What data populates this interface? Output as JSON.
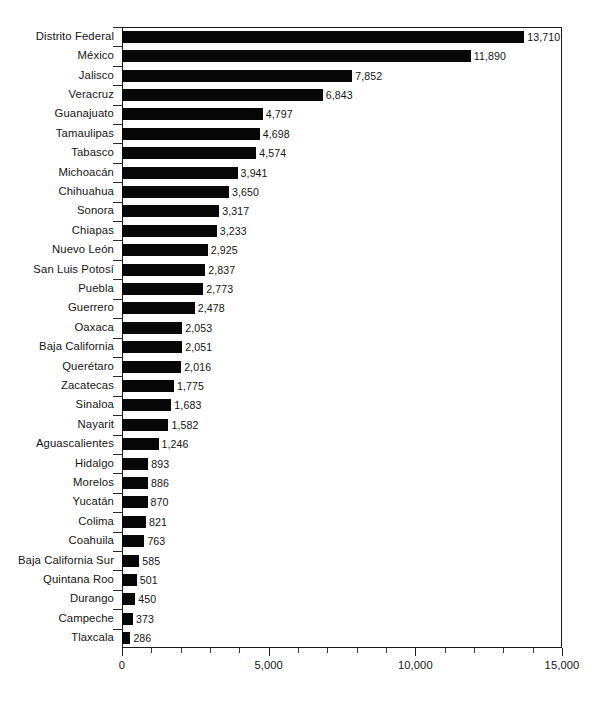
{
  "chart_data": {
    "type": "bar",
    "orientation": "horizontal",
    "title": "",
    "subtitle": "",
    "xlabel": "",
    "ylabel": "",
    "xlim": [
      0,
      15000
    ],
    "grid": false,
    "legend": null,
    "bar_color": "#070707",
    "background_color": "#ffffff",
    "axis_color": "#1a1a1a",
    "text_color": "#141414",
    "x_tick_labels": [
      "0",
      "5,000",
      "10,000",
      "15,000"
    ],
    "x_tick_values": [
      0,
      5000,
      10000,
      15000
    ],
    "x_minor_tick_step": 1000,
    "categories": [
      "Distrito Federal",
      "México",
      "Jalisco",
      "Veracruz",
      "Guanajuato",
      "Tamaulipas",
      "Tabasco",
      "Michoacán",
      "Chihuahua",
      "Sonora",
      "Chiapas",
      "Nuevo León",
      "San Luis Potosí",
      "Puebla",
      "Guerrero",
      "Oaxaca",
      "Baja California",
      "Querétaro",
      "Zacatecas",
      "Sinaloa",
      "Nayarit",
      "Aguascalientes",
      "Hidalgo",
      "Morelos",
      "Yucatán",
      "Colima",
      "Coahuila",
      "Baja California Sur",
      "Quintana Roo",
      "Durango",
      "Campeche",
      "Tlaxcala"
    ],
    "values": [
      13710,
      11890,
      7852,
      6843,
      4797,
      4698,
      4574,
      3941,
      3650,
      3317,
      3233,
      2925,
      2837,
      2773,
      2478,
      2053,
      2051,
      2016,
      1775,
      1683,
      1582,
      1246,
      893,
      886,
      870,
      821,
      763,
      585,
      501,
      450,
      373,
      286
    ],
    "value_labels": [
      "13,710",
      "11,890",
      "7,852",
      "6,843",
      "4,797",
      "4,698",
      "4,574",
      "3,941",
      "3,650",
      "3,317",
      "3,233",
      "2,925",
      "2,837",
      "2,773",
      "2,478",
      "2,053",
      "2,051",
      "2,016",
      "1,775",
      "1,683",
      "1,582",
      "1,246",
      "893",
      "886",
      "870",
      "821",
      "763",
      "585",
      "501",
      "450",
      "373",
      "286"
    ]
  }
}
